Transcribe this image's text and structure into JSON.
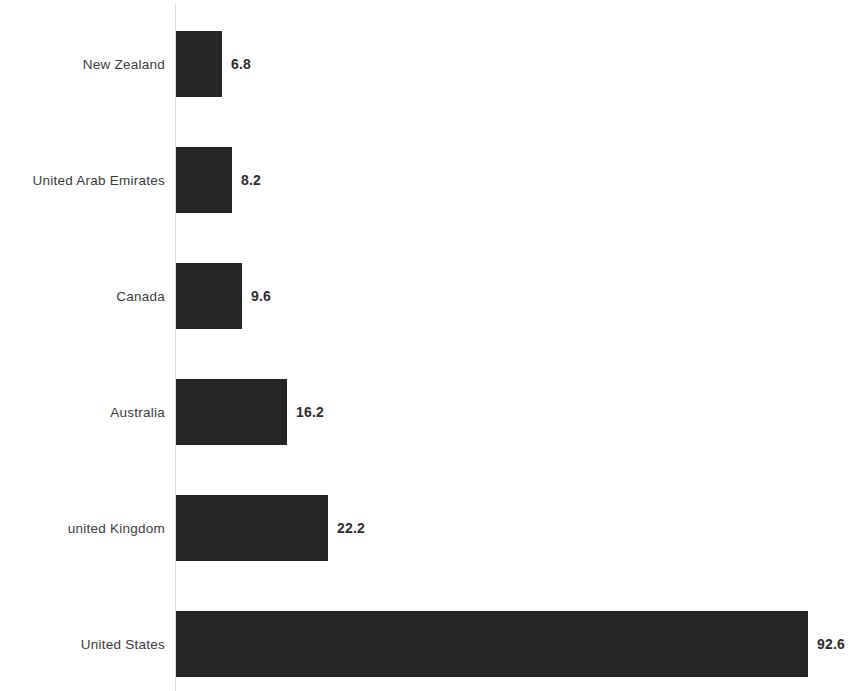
{
  "chart_data": {
    "type": "bar",
    "orientation": "horizontal",
    "title": "",
    "subtitle": "",
    "xlabel": "",
    "ylabel": "",
    "legend": [],
    "legend_position": "none",
    "grid": false,
    "axis_visible": true,
    "value_labels_shown": true,
    "xlim": [
      0,
      92.6
    ],
    "categories": [
      "New Zealand",
      "United Arab Emirates",
      "Canada",
      "Australia",
      "united Kingdom",
      "United States"
    ],
    "values": [
      6.8,
      8.2,
      9.6,
      16.2,
      22.2,
      92.6
    ],
    "value_labels": [
      "6.8",
      "8.2",
      "9.6",
      "16.2",
      "22.2",
      "92.6"
    ],
    "colors": {
      "bar": "#252525",
      "axis_line": "#d8d8d8",
      "category_label": "#3b3b3b",
      "value_label": "#2e2e2e",
      "background": "#ffffff"
    }
  }
}
